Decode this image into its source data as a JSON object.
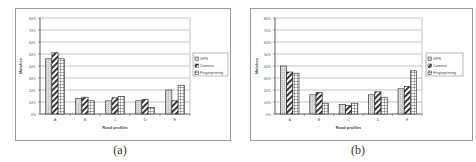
{
  "chart_data": [
    {
      "id": "a",
      "type": "bar",
      "caption": "(a)",
      "title": "",
      "xlabel": "Road profiles",
      "ylabel": "Matches",
      "categories": [
        "A",
        "B",
        "C",
        "D",
        "E"
      ],
      "yticks": [
        "0%",
        "10%",
        "20%",
        "30%",
        "40%",
        "50%",
        "60%",
        "70%",
        "80%"
      ],
      "ylim": [
        0,
        80
      ],
      "grid": true,
      "legend_position": "right",
      "series": [
        {
          "name": "GPS",
          "pattern": "dots",
          "values": [
            46,
            13,
            11,
            11,
            20
          ]
        },
        {
          "name": "Camera",
          "pattern": "diagonal",
          "values": [
            51,
            14,
            13.5,
            12,
            11
          ]
        },
        {
          "name": "Fingerprinting",
          "pattern": "grid",
          "values": [
            46,
            11,
            14.5,
            5.5,
            24
          ]
        }
      ]
    },
    {
      "id": "b",
      "type": "bar",
      "caption": "(b)",
      "title": "",
      "xlabel": "Road profiles",
      "ylabel": "Matches",
      "categories": [
        "A",
        "B",
        "C",
        "D",
        "E"
      ],
      "yticks": [
        "0%",
        "10%",
        "20%",
        "30%",
        "40%",
        "50%",
        "60%",
        "70%",
        "80%"
      ],
      "ylim": [
        0,
        80
      ],
      "grid": true,
      "legend_position": "right",
      "series": [
        {
          "name": "GPS",
          "pattern": "dots",
          "values": [
            40,
            16,
            8,
            16,
            21
          ]
        },
        {
          "name": "Camera",
          "pattern": "diagonal",
          "values": [
            35,
            18,
            7,
            18.5,
            23
          ]
        },
        {
          "name": "Fingerprinting",
          "pattern": "grid",
          "values": [
            34,
            9,
            9,
            14,
            36
          ]
        }
      ]
    }
  ],
  "figures": {
    "a": {
      "caption": "(a)"
    },
    "b": {
      "caption": "(b)"
    }
  }
}
